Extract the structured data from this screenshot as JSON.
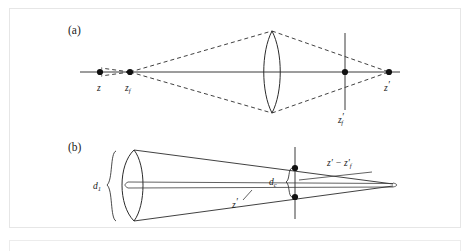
{
  "figure": {
    "type": "optical-ray-diagram",
    "background_color": "#ffffff",
    "line_color": "#2b2b2b",
    "frame_color": "#e6e6e6"
  },
  "panels": [
    {
      "id": "a",
      "label": "(a)",
      "label_x": 68,
      "label_y": 34,
      "optical_axis_y": 72,
      "elements": {
        "object_point": {
          "name": "z",
          "label": "z",
          "x": 100,
          "y": 72,
          "label_x": 97,
          "label_y": 90
        },
        "focus_point": {
          "name": "z_f",
          "label": "z",
          "sub": "f",
          "x": 130,
          "y": 72,
          "label_x": 126,
          "label_y": 90
        },
        "lens": {
          "name": "converging-lens",
          "cx": 272,
          "cy": 72,
          "half_height": 41,
          "bulge": 11
        },
        "sensor_plane": {
          "name": "z'_f",
          "label": "z",
          "prime": "′",
          "sub": "f",
          "x": 345,
          "y_top": 33,
          "y_bottom": 110,
          "label_x": 339,
          "label_y": 122
        },
        "image_point": {
          "name": "z'",
          "label": "z",
          "prime": "′",
          "x": 389,
          "y": 72,
          "label_x": 385,
          "label_y": 90
        }
      }
    },
    {
      "id": "b",
      "label": "(b)",
      "label_x": 68,
      "label_y": 151,
      "axis_y": 185,
      "elements": {
        "lens_aperture": {
          "name": "lens-aperture",
          "cx": 128,
          "cy": 185,
          "half_height": 35,
          "bulge": 9
        },
        "aperture_brace": {
          "name": "d1-brace",
          "x": 112,
          "y_top": 151,
          "y_bottom": 221
        },
        "aperture_label": {
          "label": "d",
          "sub": "1",
          "x": 97,
          "y": 189
        },
        "blur_plane": {
          "name": "blur-plane-line",
          "x": 295,
          "y_top": 147,
          "y_bottom": 219
        },
        "blur_dot_top": {
          "x": 295,
          "y": 168
        },
        "blur_dot_bottom": {
          "x": 295,
          "y": 197
        },
        "blur_brace": {
          "name": "dc-brace",
          "x": 290,
          "y_top": 168,
          "y_bottom": 197
        },
        "blur_label": {
          "label": "d",
          "sub": "c",
          "x": 273,
          "y": 181
        },
        "cone_apex": {
          "x": 393,
          "y": 185
        },
        "distance_label": {
          "label": "z′ − z′",
          "sub": "f",
          "x": 330,
          "y": 165
        },
        "inner_label": {
          "label": "z",
          "prime": "′",
          "x": 237,
          "y": 204
        }
      }
    }
  ],
  "labels": {
    "panel_a": "(a)",
    "panel_b": "(b)",
    "z": "z",
    "z_f": "z",
    "z_f_sub": "f",
    "z_prime": "z",
    "prime_mark": "′",
    "z_prime_f": "z",
    "z_prime_f_sub": "f",
    "d_1": "d",
    "d_1_sub": "1",
    "d_c": "d",
    "d_c_sub": "c",
    "z_prime_minus": "z′ − z′",
    "z_prime_minus_sub": "f",
    "minus_sign": "−"
  }
}
